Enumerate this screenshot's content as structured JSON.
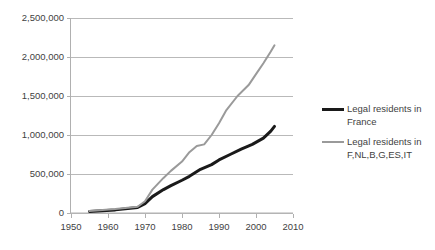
{
  "chart_data": {
    "type": "line",
    "title": "",
    "subtitle": "",
    "xlabel": "",
    "ylabel": "",
    "xlim": [
      1950,
      2010
    ],
    "ylim": [
      0,
      2500000
    ],
    "grid": true,
    "legend_position": "right",
    "x_ticks": [
      "1950",
      "1960",
      "1970",
      "1980",
      "1990",
      "2000",
      "2010"
    ],
    "x_tick_values": [
      1950,
      1960,
      1970,
      1980,
      1990,
      2000,
      2010
    ],
    "y_ticks": [
      "0",
      "500,000",
      "1,000,000",
      "1,500,000",
      "2,000,000",
      "2,500,000"
    ],
    "y_tick_values": [
      0,
      500000,
      1000000,
      1500000,
      2000000,
      2500000
    ],
    "series": [
      {
        "name": "Legal residents in France",
        "color": "#1a1a1a",
        "width": 3,
        "x": [
          1955,
          1962,
          1968,
          1970,
          1972,
          1975,
          1977,
          1980,
          1982,
          1985,
          1988,
          1990,
          1993,
          1996,
          1999,
          2002,
          2004,
          2005
        ],
        "values": [
          20000,
          40000,
          70000,
          120000,
          210000,
          300000,
          350000,
          420000,
          470000,
          560000,
          620000,
          680000,
          750000,
          820000,
          880000,
          960000,
          1050000,
          1110000
        ]
      },
      {
        "name": "Legal residents in F,NL,B,G,ES,IT",
        "color": "#9a9a9a",
        "width": 2,
        "x": [
          1955,
          1962,
          1968,
          1970,
          1972,
          1975,
          1977,
          1980,
          1982,
          1984,
          1986,
          1988,
          1990,
          1992,
          1995,
          1998,
          2000,
          2002,
          2004,
          2005
        ],
        "values": [
          25000,
          50000,
          80000,
          150000,
          300000,
          450000,
          540000,
          660000,
          780000,
          860000,
          880000,
          1000000,
          1150000,
          1320000,
          1500000,
          1640000,
          1780000,
          1920000,
          2070000,
          2150000
        ]
      }
    ]
  },
  "legend": {
    "entries": [
      {
        "label": "Legal residents in France",
        "color": "#1a1a1a",
        "thickness": "thick"
      },
      {
        "label": "Legal residents in F,NL,B,G,ES,IT",
        "color": "#9a9a9a",
        "thickness": "thin"
      }
    ]
  },
  "colors": {
    "background": "#ffffff",
    "gridline": "#b9b9b9",
    "axis": "#b0b0b0",
    "text": "#3f3f3f",
    "series_france": "#1a1a1a",
    "series_group": "#9a9a9a"
  }
}
